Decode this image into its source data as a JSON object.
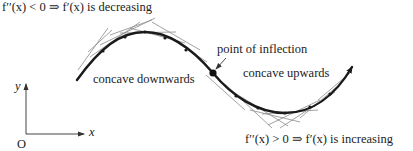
{
  "labels": {
    "top_condition": "f′′(x) < 0 ⇒ f′(x) is decreasing",
    "bottom_condition": "f′′(x) > 0 ⇒ f′(x) is increasing",
    "inflection": "point of inflection",
    "concave_down": "concave downwards",
    "concave_up": "concave upwards",
    "axis_y": "y",
    "axis_x": "x",
    "origin": "O"
  },
  "colors": {
    "curve": "#1a1a1a",
    "tangent": "#8a8a8a",
    "text": "#222222",
    "background": "#ffffff"
  },
  "curve": {
    "start": [
      77,
      80
    ],
    "maximum": [
      145,
      32
    ],
    "inflection_point": [
      213,
      73
    ],
    "minimum": [
      285,
      113
    ],
    "end_arrow": [
      352,
      67
    ]
  }
}
